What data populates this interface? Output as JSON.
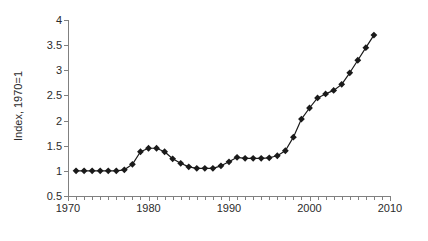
{
  "chart_data": {
    "type": "line",
    "title": "",
    "subtitle": "",
    "xlabel": "",
    "ylabel": "Index, 1970=1",
    "xlim": [
      1970,
      2010
    ],
    "ylim": [
      0.5,
      4
    ],
    "grid": false,
    "legend": "none",
    "marker": "diamond",
    "marker_color": "#1a1a1a",
    "line_color": "#1a1a1a",
    "axis_color": "#808080",
    "x_major_ticks": [
      1970,
      1980,
      1990,
      2000,
      2010
    ],
    "x_tick_labels": [
      "1970",
      "1980",
      "1990",
      "2000",
      "2010"
    ],
    "x_minor_tick_interval": 1,
    "y_ticks": [
      0.5,
      1,
      1.5,
      2,
      2.5,
      3,
      3.5,
      4
    ],
    "y_tick_labels": [
      "0.5",
      "1",
      "1.5",
      "2",
      "2.5",
      "3",
      "3.5",
      "4"
    ],
    "series": [
      {
        "name": "Index",
        "x": [
          1971,
          1972,
          1973,
          1974,
          1975,
          1976,
          1977,
          1978,
          1979,
          1980,
          1981,
          1982,
          1983,
          1984,
          1985,
          1986,
          1987,
          1988,
          1989,
          1990,
          1991,
          1992,
          1993,
          1994,
          1995,
          1996,
          1997,
          1998,
          1999,
          2000,
          2001,
          2002,
          2003,
          2004,
          2005,
          2006,
          2007,
          2008
        ],
        "values": [
          1.0,
          1.0,
          1.0,
          1.0,
          1.0,
          1.0,
          1.02,
          1.13,
          1.38,
          1.45,
          1.45,
          1.38,
          1.24,
          1.15,
          1.08,
          1.05,
          1.05,
          1.05,
          1.1,
          1.18,
          1.27,
          1.25,
          1.25,
          1.25,
          1.26,
          1.3,
          1.4,
          1.67,
          2.03,
          2.25,
          2.45,
          2.53,
          2.6,
          2.72,
          2.95,
          3.2,
          3.45,
          3.7
        ]
      }
    ],
    "peak": {
      "year": 2007,
      "value": 3.72
    },
    "final_point": {
      "year": 2008,
      "value": 3.2
    }
  }
}
